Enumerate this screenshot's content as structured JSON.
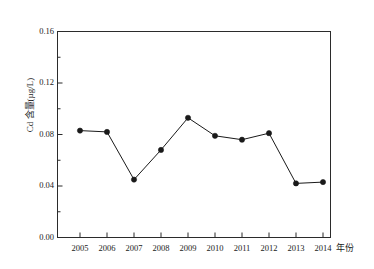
{
  "chart_data": {
    "type": "line",
    "title": "",
    "xlabel": "年份",
    "ylabel": "Cd 含量(µg/L)",
    "ylabel_main": "Cd 含量",
    "ylabel_unit": "(µg/L)",
    "categories": [
      "2005",
      "2006",
      "2007",
      "2008",
      "2009",
      "2010",
      "2011",
      "2012",
      "2013",
      "2014"
    ],
    "x": [
      2005,
      2006,
      2007,
      2008,
      2009,
      2010,
      2011,
      2012,
      2013,
      2014
    ],
    "values": [
      0.083,
      0.082,
      0.045,
      0.068,
      0.093,
      0.079,
      0.076,
      0.081,
      0.042,
      0.043
    ],
    "series": [
      {
        "name": "Cd 含量",
        "values": [
          0.083,
          0.082,
          0.045,
          0.068,
          0.093,
          0.079,
          0.076,
          0.081,
          0.042,
          0.043
        ],
        "color": "#1a1a1a",
        "marker": "filled-circle"
      }
    ],
    "ylim": [
      0.0,
      0.16
    ],
    "yticks": [
      0.0,
      0.04,
      0.08,
      0.12,
      0.16
    ],
    "ytick_labels": [
      "0.00",
      "0.04",
      "0.08",
      "0.12",
      "0.16"
    ],
    "yminor_ticks": [
      0.02,
      0.06,
      0.1,
      0.14
    ],
    "grid": false,
    "legend": null,
    "legend_position": "none",
    "frame": "box",
    "line_color": "#1a1a1a",
    "marker_color": "#1a1a1a",
    "background": "#ffffff"
  },
  "axes": {
    "x_axis_name": "年份",
    "y_axis_name": "Cd 含量(µg/L)"
  }
}
